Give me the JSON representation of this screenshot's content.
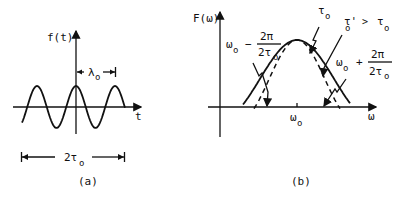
{
  "panel_a": {
    "y_axis_label": "f(t)",
    "x_axis_label": "t",
    "wavelength_label": "λ",
    "wavelength_subscript": "o",
    "duration_label": "2τ",
    "duration_subscript": "o",
    "caption": "(a)"
  },
  "panel_b": {
    "y_axis_label": "F(ω)",
    "x_axis_label": "ω",
    "center_label": "ω",
    "center_subscript": "o",
    "lower_zero": {
      "base": "ω",
      "sub": "o",
      "op": "−",
      "num": "2π",
      "den": "2τ",
      "den_sub": "o"
    },
    "upper_zero": {
      "base": "ω",
      "sub": "o",
      "op": "+",
      "num": "2π",
      "den": "2τ",
      "den_sub": "o"
    },
    "tau_label": "τ",
    "tau_subscript": "o",
    "tau_prime_label": "τ'",
    "tau_prime_subscript": "o",
    "tau_prime_relation": ">",
    "tau_prime_rhs": "τ",
    "tau_prime_rhs_subscript": "o",
    "caption": "(b)",
    "legend": {
      "solid": "spectrum for duration τo",
      "dashed": "spectrum for duration τ'o > τo"
    }
  }
}
